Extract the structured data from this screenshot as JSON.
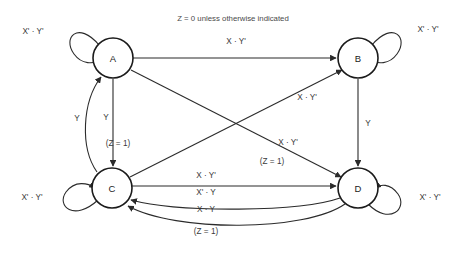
{
  "diagram": {
    "type": "finite-state-machine-transition-diagram",
    "caption": "Z = 0 unless otherwise indicated",
    "output_default": "Z = 0",
    "states": [
      {
        "id": "A",
        "label": "A",
        "cx": 113,
        "cy": 58,
        "r": 20
      },
      {
        "id": "B",
        "label": "B",
        "cx": 358,
        "cy": 58,
        "r": 20
      },
      {
        "id": "C",
        "label": "C",
        "cx": 112,
        "cy": 188,
        "r": 20
      },
      {
        "id": "D",
        "label": "D",
        "cx": 358,
        "cy": 188,
        "r": 20
      }
    ],
    "self_loops": [
      {
        "state": "A",
        "label": "X' · Y'",
        "label_x": 33,
        "label_y": 31
      },
      {
        "state": "B",
        "label": "X' · Y'",
        "label_x": 428,
        "label_y": 29
      },
      {
        "state": "C",
        "label": "X' · Y'",
        "label_x": 32,
        "label_y": 197
      },
      {
        "state": "D",
        "label": "X' · Y'",
        "label_x": 430,
        "label_y": 197
      }
    ],
    "transitions": [
      {
        "from": "A",
        "to": "B",
        "label": "X · Y'",
        "output": "",
        "label_x": 236,
        "label_y": 41
      },
      {
        "from": "A",
        "to": "C",
        "label": "Y",
        "output": "(Z = 1)",
        "label_x": 106,
        "label_y": 117,
        "output_x": 118,
        "output_y": 143
      },
      {
        "from": "C",
        "to": "A",
        "label": "Y",
        "output": "",
        "label_x": 77,
        "label_y": 118
      },
      {
        "from": "B",
        "to": "D",
        "label": "Y",
        "output": "",
        "label_x": 368,
        "label_y": 123
      },
      {
        "from": "A",
        "to": "D",
        "label": "X · Y'",
        "output": "(Z = 1)",
        "label_x": 286,
        "label_y": 143,
        "output_x": 271,
        "output_y": 161
      },
      {
        "from": "C",
        "to": "B",
        "label": "X · Y'",
        "output": "",
        "label_x": 307,
        "label_y": 97
      },
      {
        "from": "C",
        "to": "D",
        "label": "X · Y'",
        "output": "",
        "label_x": 206,
        "label_y": 175
      },
      {
        "from": "D",
        "to": "C",
        "label": "X' · Y",
        "output": "",
        "label_x": 206,
        "label_y": 192
      },
      {
        "from": "D",
        "to": "C",
        "label": "X · Y",
        "output": "(Z = 1)",
        "label_x": 206,
        "label_y": 209,
        "output_x": 206,
        "output_y": 230
      }
    ],
    "inputs": [
      "X",
      "Y"
    ],
    "outputs": [
      "Z"
    ],
    "colors": {
      "background": "#ffffff",
      "node_stroke": "#1b1b1b",
      "edge_stroke": "#2b2b2b",
      "text": "#3a3a3a"
    }
  }
}
